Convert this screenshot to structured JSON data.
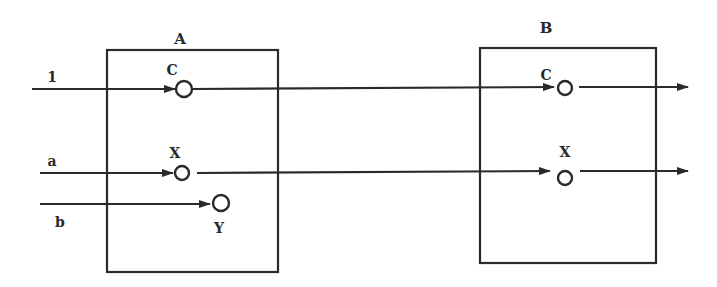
{
  "diagram": {
    "colors": {
      "stroke": "#2a2a2a",
      "background": "#ffffff"
    },
    "blocks": [
      {
        "id": "A",
        "label": "A"
      },
      {
        "id": "B",
        "label": "B"
      }
    ],
    "inputs": [
      {
        "id": "in1",
        "label": "1"
      },
      {
        "id": "ina",
        "label": "a"
      },
      {
        "id": "inb",
        "label": "b"
      }
    ],
    "nodes": {
      "A_C": {
        "label": "C"
      },
      "A_X": {
        "label": "X"
      },
      "A_Y": {
        "label": "Y"
      },
      "B_C": {
        "label": "C"
      },
      "B_X": {
        "label": "X"
      }
    },
    "connections": [
      {
        "from": "1",
        "to": "A.C"
      },
      {
        "from": "a",
        "to": "A.X"
      },
      {
        "from": "b",
        "to": "A.Y"
      },
      {
        "from": "A.C",
        "to": "B.C"
      },
      {
        "from": "A.X",
        "to": "B.X"
      },
      {
        "from": "B.C",
        "to": "output"
      },
      {
        "from": "B.X",
        "to": "output"
      }
    ]
  }
}
